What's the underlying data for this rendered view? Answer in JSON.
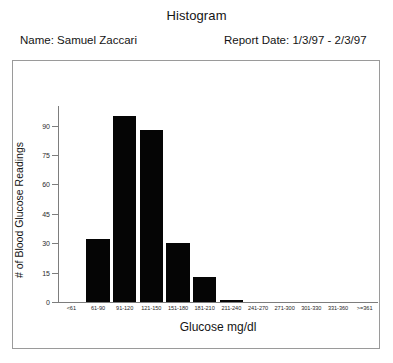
{
  "header": {
    "title": "Histogram",
    "name_label": "Name: Samuel Zaccari",
    "date_label": "Report Date: 1/3/97 - 2/3/97"
  },
  "chart_data": {
    "type": "bar",
    "title": "Histogram",
    "xlabel": "Glucose mg/dl",
    "ylabel": "# of Blood Glucose Readings",
    "categories": [
      "<61",
      "61-90",
      "91-120",
      "121-150",
      "151-180",
      "181-210",
      "211-240",
      "241-270",
      "271-300",
      "301-330",
      "331-360",
      ">=361"
    ],
    "values": [
      0,
      32,
      95,
      88,
      30,
      13,
      1,
      0,
      0,
      0,
      0,
      0
    ],
    "ylim": [
      0,
      100
    ],
    "yticks": [
      0,
      15,
      30,
      45,
      60,
      75,
      90
    ],
    "ytick_labels": [
      "0",
      "15",
      "30",
      "45",
      "60",
      "75",
      "90"
    ],
    "grid": false,
    "legend": null,
    "bar_color": "#050505",
    "axis_color": "#7d7d7d"
  }
}
